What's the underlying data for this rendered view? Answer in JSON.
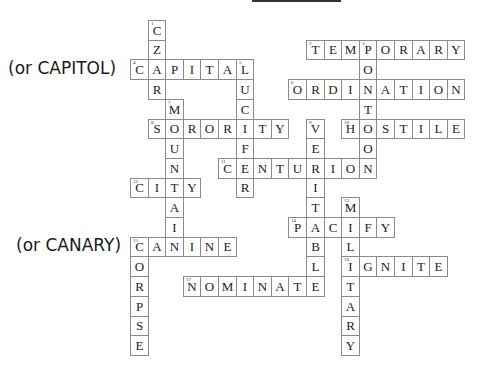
{
  "puzzle": {
    "grid": {
      "x0": 130,
      "y0": 20,
      "cell_w": 17.6,
      "cell_h": 19.7
    },
    "notes": [
      {
        "text": "(or CAPITOL)",
        "x": 8,
        "y": 60
      },
      {
        "text": "(or CANARY)",
        "x": 16,
        "y": 237
      }
    ],
    "words": [
      {
        "num": "1",
        "answer": "CZAR",
        "dir": "down",
        "row": 0,
        "col": 1
      },
      {
        "num": "2",
        "answer": "TEMPORARY",
        "dir": "across",
        "row": 1,
        "col": 10
      },
      {
        "num": "3",
        "answer": "PONTOON",
        "dir": "down",
        "row": 1,
        "col": 13
      },
      {
        "num": "4",
        "answer": "CAPITAL",
        "dir": "across",
        "row": 2,
        "col": 0
      },
      {
        "num": "5",
        "answer": "LUCIFER",
        "dir": "down",
        "row": 2,
        "col": 6
      },
      {
        "num": "6",
        "answer": "ORDINATION",
        "dir": "across",
        "row": 3,
        "col": 9
      },
      {
        "num": "7",
        "answer": "MOUNTAIN",
        "dir": "down",
        "row": 4,
        "col": 2
      },
      {
        "num": "8",
        "answer": "SORORITY",
        "dir": "across",
        "row": 5,
        "col": 1
      },
      {
        "num": "9",
        "answer": "VERITABLE",
        "dir": "down",
        "row": 5,
        "col": 10
      },
      {
        "num": "10",
        "answer": "HOSTILE",
        "dir": "across",
        "row": 5,
        "col": 12
      },
      {
        "num": "11",
        "answer": "CENTURION",
        "dir": "across",
        "row": 7,
        "col": 5
      },
      {
        "num": "12",
        "answer": "CITY",
        "dir": "across",
        "row": 8,
        "col": 0
      },
      {
        "num": "13",
        "answer": "MILITARY",
        "dir": "down",
        "row": 9,
        "col": 12
      },
      {
        "num": "14",
        "answer": "PACIFY",
        "dir": "across",
        "row": 10,
        "col": 9
      },
      {
        "num": "15",
        "answer": "CANINE",
        "dir": "across",
        "row": 11,
        "col": 0
      },
      {
        "num": "15d",
        "answer": "CORPSE",
        "dir": "down",
        "row": 11,
        "col": 0
      },
      {
        "num": "16",
        "answer": "IGNITE",
        "dir": "across",
        "row": 12,
        "col": 12
      },
      {
        "num": "17",
        "answer": "NOMINATE",
        "dir": "across",
        "row": 13,
        "col": 3
      }
    ]
  }
}
